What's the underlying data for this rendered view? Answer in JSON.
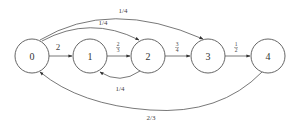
{
  "diagram": {
    "type": "state-transition-graph",
    "nodes": [
      {
        "id": "0",
        "label": "0",
        "cx": 32,
        "cy": 56
      },
      {
        "id": "1",
        "label": "1",
        "cx": 90,
        "cy": 56
      },
      {
        "id": "2",
        "label": "2",
        "cx": 148,
        "cy": 56
      },
      {
        "id": "3",
        "label": "3",
        "cx": 208,
        "cy": 56
      },
      {
        "id": "4",
        "label": "4",
        "cx": 268,
        "cy": 56
      }
    ],
    "edges": [
      {
        "from": "0",
        "to": "1",
        "label": "2"
      },
      {
        "from": "1",
        "to": "2",
        "label": "2/3",
        "num": "2",
        "den": "3"
      },
      {
        "from": "2",
        "to": "3",
        "label": "3/4",
        "num": "3",
        "den": "4"
      },
      {
        "from": "3",
        "to": "4",
        "label": "1/2",
        "num": "1",
        "den": "2"
      },
      {
        "from": "0",
        "to": "2",
        "label": "1/4"
      },
      {
        "from": "0",
        "to": "3",
        "label": "1/4"
      },
      {
        "from": "2",
        "to": "1",
        "label": "1/4"
      },
      {
        "from": "4",
        "to": "0",
        "label": "2/3"
      }
    ]
  }
}
